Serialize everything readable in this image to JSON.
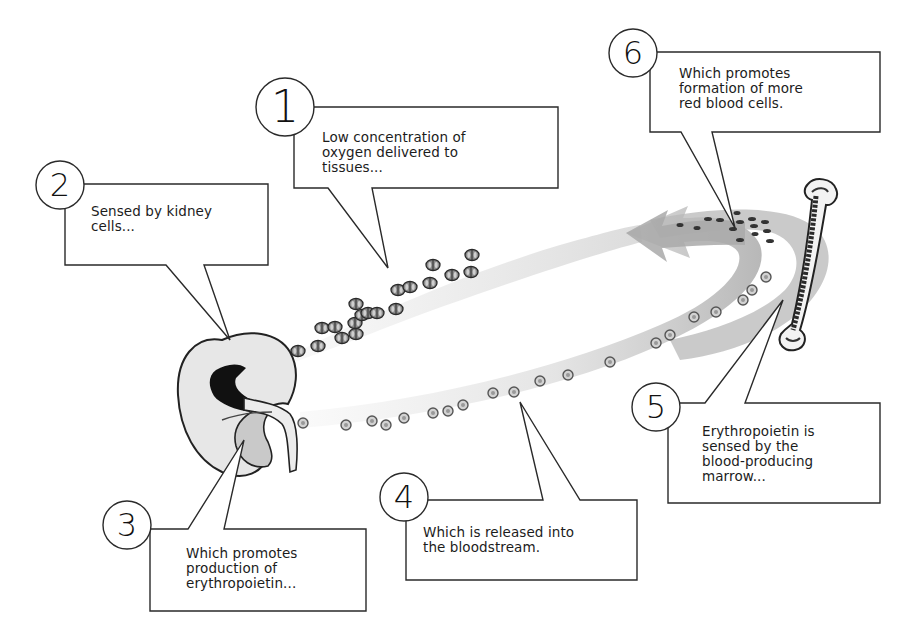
{
  "diagram": {
    "topic": "Erythropoietin feedback loop",
    "colors": {
      "background": "#ffffff",
      "line": "#2a2a2a",
      "stream_shade": "#c8c8c8",
      "arrow_shade": "#b0b0b0",
      "kidney_fill": "#e6e6e6",
      "kidney_pelvis": "#111111",
      "bone_fill": "#f2f2f2",
      "bone_marrow": "#333333"
    },
    "illustrations": {
      "kidney": "kidney-icon",
      "bone": "femur-bone-icon",
      "red_blood_cells": "red-blood-cell-icon",
      "erythropoietin_molecules": "erythropoietin-molecule-icon",
      "return_arrow": "curved-arrow-icon"
    },
    "steps": [
      {
        "number": "1",
        "text": "Low concentration of\noxygen delivered to\ntissues..."
      },
      {
        "number": "2",
        "text": "Sensed by kidney\ncells..."
      },
      {
        "number": "3",
        "text": "Which promotes\nproduction of\nerythropoietin..."
      },
      {
        "number": "4",
        "text": "Which is released into\nthe bloodstream."
      },
      {
        "number": "5",
        "text": "Erythropoietin is\nsensed by the\nblood-producing\nmarrow..."
      },
      {
        "number": "6",
        "text": "Which promotes\nformation of more\nred blood cells."
      }
    ]
  }
}
